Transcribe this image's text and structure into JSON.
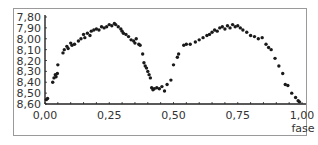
{
  "chart_data": {
    "type": "scatter",
    "title": "",
    "xlabel": "fase",
    "ylabel": "",
    "xlim": [
      0,
      1
    ],
    "ylim": [
      8.6,
      7.8
    ],
    "y_inverted": true,
    "grid": false,
    "legend": null,
    "x_ticks": [
      "0,00",
      "0,25",
      "0,50",
      "0,75",
      "1,00"
    ],
    "x_tick_values": [
      0,
      0.25,
      0.5,
      0.75,
      1.0
    ],
    "y_ticks": [
      "7,80",
      "7,90",
      "8,00",
      "8,10",
      "8,20",
      "8,30",
      "8,40",
      "8,50",
      "8,60"
    ],
    "y_tick_values": [
      7.8,
      7.9,
      8.0,
      8.1,
      8.2,
      8.3,
      8.4,
      8.5,
      8.6
    ],
    "marker_color": "#1a1a1a",
    "points": [
      [
        0.005,
        8.56
      ],
      [
        0.01,
        8.55
      ],
      [
        0.03,
        8.4
      ],
      [
        0.035,
        8.36
      ],
      [
        0.04,
        8.33
      ],
      [
        0.043,
        8.35
      ],
      [
        0.048,
        8.32
      ],
      [
        0.05,
        8.24
      ],
      [
        0.07,
        8.13
      ],
      [
        0.075,
        8.1
      ],
      [
        0.085,
        8.07
      ],
      [
        0.09,
        8.09
      ],
      [
        0.1,
        8.04
      ],
      [
        0.105,
        8.06
      ],
      [
        0.115,
        8.05
      ],
      [
        0.13,
        8.02
      ],
      [
        0.14,
        8.0
      ],
      [
        0.15,
        7.96
      ],
      [
        0.155,
        7.99
      ],
      [
        0.165,
        7.95
      ],
      [
        0.175,
        7.97
      ],
      [
        0.18,
        7.93
      ],
      [
        0.19,
        7.92
      ],
      [
        0.2,
        7.91
      ],
      [
        0.21,
        7.92
      ],
      [
        0.22,
        7.89
      ],
      [
        0.23,
        7.9
      ],
      [
        0.24,
        7.89
      ],
      [
        0.25,
        7.87
      ],
      [
        0.26,
        7.88
      ],
      [
        0.27,
        7.86
      ],
      [
        0.275,
        7.87
      ],
      [
        0.285,
        7.89
      ],
      [
        0.295,
        7.91
      ],
      [
        0.3,
        7.93
      ],
      [
        0.305,
        7.95
      ],
      [
        0.315,
        7.96
      ],
      [
        0.325,
        7.98
      ],
      [
        0.335,
        8.01
      ],
      [
        0.345,
        8.02
      ],
      [
        0.35,
        8.04
      ],
      [
        0.355,
        8.0
      ],
      [
        0.365,
        8.05
      ],
      [
        0.37,
        8.06
      ],
      [
        0.38,
        8.14
      ],
      [
        0.385,
        8.22
      ],
      [
        0.39,
        8.25
      ],
      [
        0.395,
        8.27
      ],
      [
        0.4,
        8.3
      ],
      [
        0.405,
        8.33
      ],
      [
        0.41,
        8.36
      ],
      [
        0.415,
        8.45
      ],
      [
        0.42,
        8.47
      ],
      [
        0.425,
        8.46
      ],
      [
        0.435,
        8.45
      ],
      [
        0.445,
        8.46
      ],
      [
        0.455,
        8.44
      ],
      [
        0.465,
        8.48
      ],
      [
        0.475,
        8.42
      ],
      [
        0.49,
        8.38
      ],
      [
        0.5,
        8.24
      ],
      [
        0.515,
        8.17
      ],
      [
        0.52,
        8.14
      ],
      [
        0.54,
        8.06
      ],
      [
        0.55,
        8.05
      ],
      [
        0.565,
        8.05
      ],
      [
        0.585,
        8.03
      ],
      [
        0.6,
        8.01
      ],
      [
        0.615,
        7.99
      ],
      [
        0.63,
        7.97
      ],
      [
        0.64,
        7.96
      ],
      [
        0.65,
        7.94
      ],
      [
        0.66,
        7.92
      ],
      [
        0.67,
        7.93
      ],
      [
        0.68,
        7.9
      ],
      [
        0.69,
        7.89
      ],
      [
        0.7,
        7.91
      ],
      [
        0.71,
        7.88
      ],
      [
        0.72,
        7.9
      ],
      [
        0.73,
        7.87
      ],
      [
        0.74,
        7.89
      ],
      [
        0.75,
        7.88
      ],
      [
        0.76,
        7.9
      ],
      [
        0.77,
        7.92
      ],
      [
        0.785,
        7.94
      ],
      [
        0.8,
        7.97
      ],
      [
        0.815,
        7.98
      ],
      [
        0.83,
        8.0
      ],
      [
        0.845,
        7.99
      ],
      [
        0.86,
        8.05
      ],
      [
        0.87,
        8.08
      ],
      [
        0.88,
        8.1
      ],
      [
        0.895,
        8.18
      ],
      [
        0.91,
        8.25
      ],
      [
        0.925,
        8.32
      ],
      [
        0.935,
        8.42
      ],
      [
        0.945,
        8.43
      ],
      [
        0.96,
        8.5
      ],
      [
        0.975,
        8.54
      ],
      [
        0.985,
        8.57
      ],
      [
        0.99,
        8.58
      ]
    ]
  }
}
